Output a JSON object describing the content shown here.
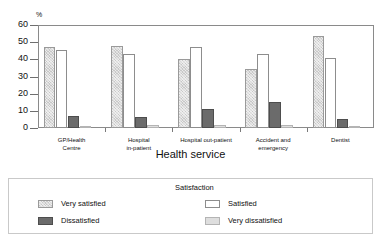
{
  "chart_data": {
    "type": "bar",
    "title": "",
    "xlabel": "Health service",
    "ylabel": "%",
    "ylim": [
      0,
      60
    ],
    "yticks": [
      0,
      10,
      20,
      30,
      40,
      50,
      60
    ],
    "grid": false,
    "legend_position": "bottom",
    "legend_title": "Satisfaction",
    "categories": [
      "GP/Health Centre",
      "Hospital in-patient",
      "Hospital out-patient",
      "Accident and emergency",
      "Dentist"
    ],
    "category_lines": [
      [
        "GP/Health",
        "Centre"
      ],
      [
        "Hospital",
        "in-patient"
      ],
      [
        "Hospital out-patient"
      ],
      [
        "Accident and",
        "emergency"
      ],
      [
        "Dentist"
      ]
    ],
    "series": [
      {
        "name": "Very satisfied",
        "values": [
          47,
          48,
          40,
          34.5,
          53.5
        ],
        "color": "#c8c8c8"
      },
      {
        "name": "Satisfied",
        "values": [
          45.5,
          43,
          47,
          43,
          40.5
        ],
        "color": "#ffffff"
      },
      {
        "name": "Dissatisfied",
        "values": [
          7,
          6.5,
          11,
          15,
          5
        ],
        "color": "#6b6b6b"
      },
      {
        "name": "Very dissatisfied",
        "values": [
          1,
          1.5,
          1.5,
          2,
          1
        ],
        "color": "#dedede"
      }
    ]
  },
  "axis": {
    "y_unit_label": "%",
    "y_tick_labels": [
      "60",
      "50",
      "40",
      "30",
      "20",
      "10",
      "0"
    ],
    "x_axis_title": "Health service"
  },
  "legend": {
    "title": "Satisfaction",
    "items": [
      {
        "label": "Very satisfied",
        "swatch": "hatched-light-gray-swatch"
      },
      {
        "label": "Satisfied",
        "swatch": "white-swatch"
      },
      {
        "label": "Dissatisfied",
        "swatch": "dark-gray-swatch"
      },
      {
        "label": "Very dissatisfied",
        "swatch": "light-gray-swatch"
      }
    ]
  }
}
